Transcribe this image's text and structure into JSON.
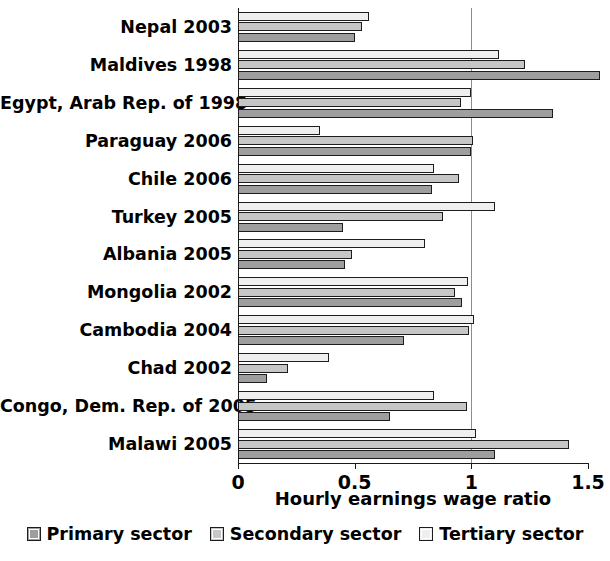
{
  "chart_data": {
    "type": "bar",
    "orientation": "horizontal",
    "title": "",
    "xlabel": "Hourly earnings wage ratio",
    "ylabel": "",
    "xlim": [
      0,
      1.5
    ],
    "xticks": [
      "0",
      "0.5",
      "1",
      "1.5"
    ],
    "xtick_values": [
      0,
      0.5,
      1,
      1.5
    ],
    "grid": "vertical gridline at 1",
    "gridline_values": [
      1
    ],
    "legend_position": "bottom-center",
    "categories": [
      "Nepal 2003",
      "Maldives 1998",
      "Egypt, Arab Rep. of 1998",
      "Paraguay 2006",
      "Chile 2006",
      "Turkey 2005",
      "Albania 2005",
      "Mongolia 2002",
      "Cambodia 2004",
      "Chad 2002",
      "Congo, Dem. Rep. of 2005",
      "Malawi 2005"
    ],
    "series": [
      {
        "name": "Tertiary sector",
        "color": "#efefef",
        "values": [
          0.56,
          1.12,
          1.0,
          0.35,
          0.84,
          1.1,
          0.8,
          0.985,
          1.01,
          0.39,
          0.84,
          1.02
        ]
      },
      {
        "name": "Secondary sector",
        "color": "#c6c6c6",
        "values": [
          0.53,
          1.23,
          0.955,
          1.005,
          0.945,
          0.88,
          0.49,
          0.93,
          0.99,
          0.215,
          0.98,
          1.42
        ]
      },
      {
        "name": "Primary sector",
        "color": "#9e9e9e",
        "values": [
          0.5,
          1.55,
          1.35,
          1.0,
          0.83,
          0.45,
          0.46,
          0.96,
          0.71,
          0.125,
          0.65,
          1.1
        ]
      }
    ]
  },
  "axis": {
    "x_title": "Hourly earnings wage ratio",
    "tick_labels": [
      "0",
      "0.5",
      "1",
      "1.5"
    ]
  },
  "legend": {
    "items": [
      {
        "label": "Primary sector",
        "color": "#9e9e9e"
      },
      {
        "label": "Secondary sector",
        "color": "#c6c6c6"
      },
      {
        "label": "Tertiary sector",
        "color": "#efefef"
      }
    ]
  }
}
